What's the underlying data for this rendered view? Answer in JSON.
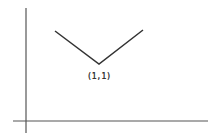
{
  "diagram": {
    "axes": {
      "y_axis": {
        "x": 26,
        "y1": 8,
        "y2": 133
      },
      "x_axis": {
        "y": 121,
        "x1": 13,
        "x2": 208
      },
      "color": "#555555"
    },
    "curve": {
      "points": [
        [
          55,
          31
        ],
        [
          99,
          64
        ],
        [
          143,
          30
        ]
      ],
      "color": "#333333"
    },
    "vertex_label": {
      "text": "(1,1)",
      "x": 99,
      "y": 72
    }
  }
}
